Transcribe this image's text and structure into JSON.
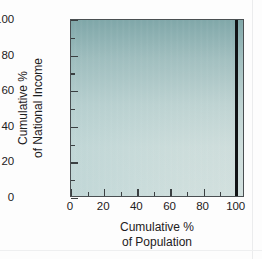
{
  "chart_data": {
    "type": "line",
    "title": "",
    "xlabel": "Cumulative % of Population",
    "xlabel_lines": [
      "Cumulative %",
      "of Population"
    ],
    "ylabel": "Cumulative % of National Income",
    "ylabel_lines": [
      "Cumulative %",
      "of National Income"
    ],
    "xlim": [
      0,
      105
    ],
    "ylim": [
      0,
      100
    ],
    "grid": false,
    "legend": null,
    "x_major_ticks": [
      0,
      20,
      40,
      60,
      80,
      100
    ],
    "x_minor_ticks": [
      10,
      30,
      50,
      70,
      90
    ],
    "y_major_ticks": [
      0,
      20,
      40,
      60,
      80,
      100
    ],
    "y_minor_ticks": [
      10,
      30,
      50,
      70,
      90
    ],
    "x_tick_labels": [
      "0",
      "20",
      "40",
      "60",
      "80",
      "100"
    ],
    "y_tick_labels": [
      "0",
      "20",
      "40",
      "60",
      "80",
      "100"
    ],
    "series": [
      {
        "name": "Lorenz curve (perfect inequality)",
        "color": "#111315",
        "x": [
          100,
          100
        ],
        "y": [
          0,
          100
        ]
      }
    ],
    "annotations": [],
    "plot_background": {
      "type": "gradient",
      "top_color": "#8fb4b5",
      "bottom_color": "#d3e0de",
      "description": "vertical teal-to-pale gradient fill"
    },
    "axis_color": "#3b4042"
  }
}
